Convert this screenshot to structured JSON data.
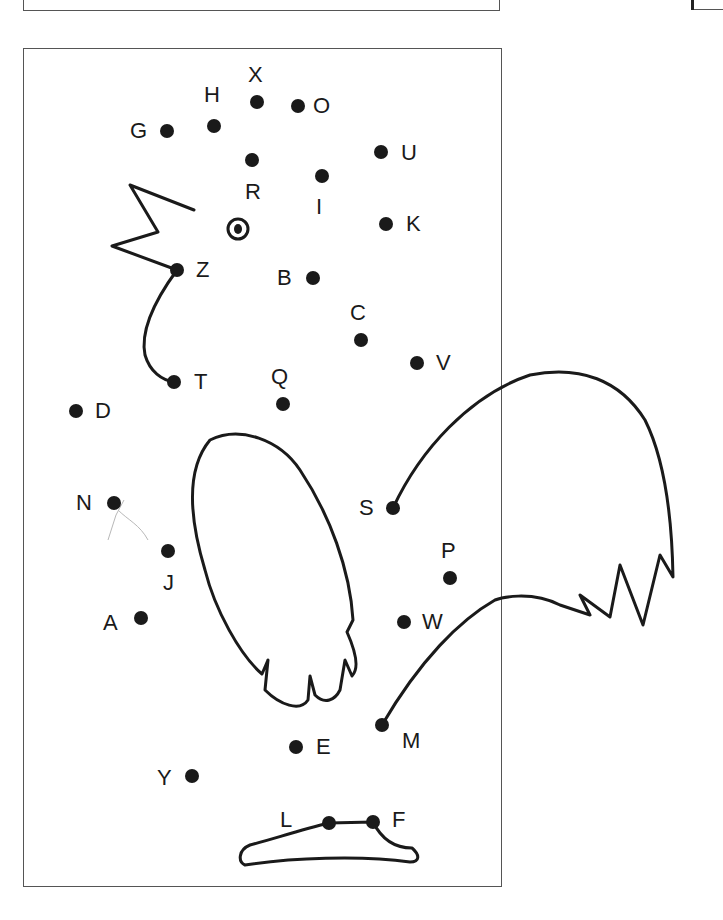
{
  "worksheet": {
    "type": "dot-to-dot",
    "subject": "rooster",
    "start_marker": "target-circle-icon",
    "ink_color": "#1a1a1a",
    "frame_color": "#555555",
    "dots": [
      {
        "label": "X",
        "x": 257,
        "y": 102,
        "lx": 248,
        "ly": 64
      },
      {
        "label": "O",
        "x": 298,
        "y": 106,
        "lx": 313,
        "ly": 95
      },
      {
        "label": "H",
        "x": 214,
        "y": 126,
        "lx": 204,
        "ly": 84
      },
      {
        "label": "G",
        "x": 167,
        "y": 131,
        "lx": 130,
        "ly": 120
      },
      {
        "label": "R",
        "x": 252,
        "y": 160,
        "lx": 245,
        "ly": 181
      },
      {
        "label": "U",
        "x": 381,
        "y": 152,
        "lx": 401,
        "ly": 142
      },
      {
        "label": "I",
        "x": 322,
        "y": 176,
        "lx": 316,
        "ly": 196
      },
      {
        "label": "K",
        "x": 386,
        "y": 224,
        "lx": 406,
        "ly": 213
      },
      {
        "label": "Z",
        "x": 177,
        "y": 270,
        "lx": 196,
        "ly": 259
      },
      {
        "label": "B",
        "x": 313,
        "y": 278,
        "lx": 277,
        "ly": 267
      },
      {
        "label": "C",
        "x": 361,
        "y": 340,
        "lx": 350,
        "ly": 302
      },
      {
        "label": "V",
        "x": 417,
        "y": 363,
        "lx": 436,
        "ly": 352
      },
      {
        "label": "T",
        "x": 174,
        "y": 382,
        "lx": 194,
        "ly": 371
      },
      {
        "label": "Q",
        "x": 283,
        "y": 404,
        "lx": 271,
        "ly": 366
      },
      {
        "label": "D",
        "x": 76,
        "y": 411,
        "lx": 95,
        "ly": 400
      },
      {
        "label": "N",
        "x": 114,
        "y": 503,
        "lx": 76,
        "ly": 492
      },
      {
        "label": "S",
        "x": 393,
        "y": 508,
        "lx": 359,
        "ly": 497
      },
      {
        "label": "J",
        "x": 168,
        "y": 551,
        "lx": 163,
        "ly": 572
      },
      {
        "label": "P",
        "x": 450,
        "y": 578,
        "lx": 441,
        "ly": 540
      },
      {
        "label": "A",
        "x": 141,
        "y": 618,
        "lx": 103,
        "ly": 612
      },
      {
        "label": "W",
        "x": 404,
        "y": 622,
        "lx": 422,
        "ly": 611
      },
      {
        "label": "M",
        "x": 382,
        "y": 725,
        "lx": 402,
        "ly": 730
      },
      {
        "label": "E",
        "x": 296,
        "y": 747,
        "lx": 316,
        "ly": 736
      },
      {
        "label": "Y",
        "x": 192,
        "y": 776,
        "lx": 157,
        "ly": 767
      },
      {
        "label": "L",
        "x": 329,
        "y": 823,
        "lx": 280,
        "ly": 809
      },
      {
        "label": "F",
        "x": 373,
        "y": 822,
        "lx": 392,
        "ly": 809
      }
    ],
    "start": {
      "x": 238,
      "y": 229
    }
  }
}
